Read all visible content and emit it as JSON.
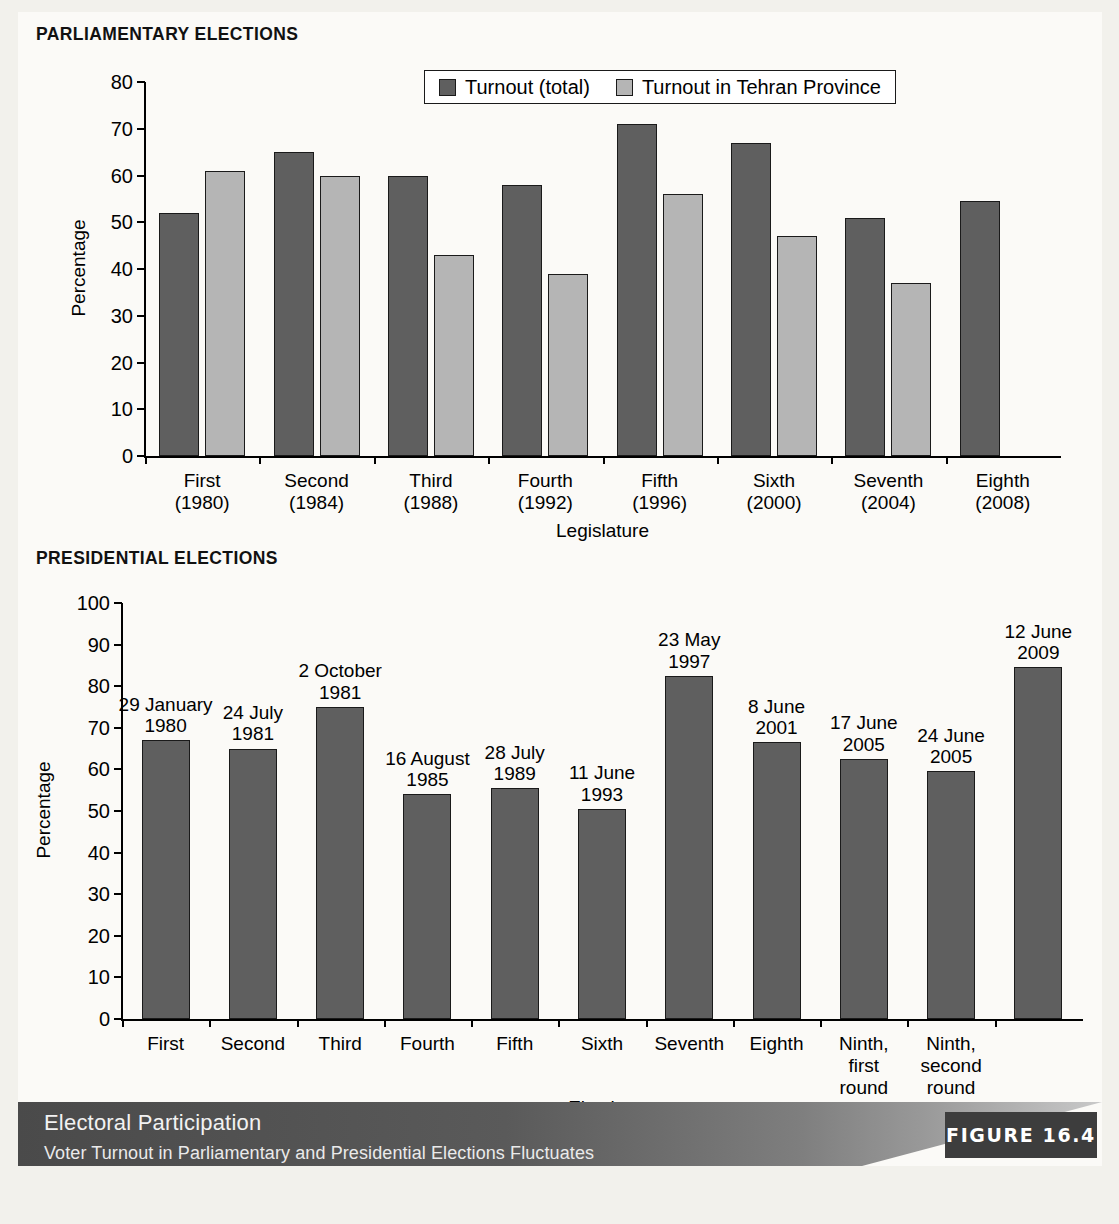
{
  "figure": {
    "banner_title": "Electoral Participation",
    "banner_subtitle": "Voter Turnout in Parliamentary and Presidential Elections Fluctuates",
    "figure_label": "FIGURE 16.4"
  },
  "colors": {
    "series_total": "#5f5f5f",
    "series_tehran": "#b5b5b5",
    "bar_outline": "#1a1a1a",
    "banner_dark": "#4a4a4a",
    "figure_box": "#3d3d3d",
    "page_background": "#f2f1ec",
    "paper_background": "#fbfaf7"
  },
  "parliamentary": {
    "section_title": "PARLIAMENTARY ELECTIONS",
    "legend": [
      {
        "label": "Turnout (total)",
        "swatch": "dark"
      },
      {
        "label": "Turnout in Tehran Province",
        "swatch": "light"
      }
    ]
  },
  "presidential": {
    "section_title": "PRESIDENTIAL ELECTIONS"
  },
  "chart_data": [
    {
      "type": "bar",
      "title": "PARLIAMENTARY ELECTIONS",
      "xlabel": "Legislature",
      "ylabel": "Percentage",
      "ylim": [
        0,
        80
      ],
      "yticks": [
        0,
        10,
        20,
        30,
        40,
        50,
        60,
        70,
        80
      ],
      "ytick_labels": [
        "0",
        "10",
        "20",
        "30",
        "40",
        "50",
        "60",
        "70",
        "80"
      ],
      "grid": false,
      "legend_position": "top-center",
      "categories": [
        "First\n(1980)",
        "Second\n(1984)",
        "Third\n(1988)",
        "Fourth\n(1992)",
        "Fifth\n(1996)",
        "Sixth\n(2000)",
        "Seventh\n(2004)",
        "Eighth\n(2008)"
      ],
      "series": [
        {
          "name": "Turnout (total)",
          "color": "#5f5f5f",
          "values": [
            52,
            65,
            60,
            58,
            71,
            67,
            51,
            54.5
          ]
        },
        {
          "name": "Turnout in Tehran Province",
          "color": "#b5b5b5",
          "values": [
            61,
            60,
            43,
            39,
            56,
            47,
            37,
            null
          ]
        }
      ]
    },
    {
      "type": "bar",
      "title": "PRESIDENTIAL ELECTIONS",
      "xlabel": "Election",
      "ylabel": "Percentage",
      "ylim": [
        0,
        100
      ],
      "yticks": [
        0,
        10,
        20,
        30,
        40,
        50,
        60,
        70,
        80,
        90,
        100
      ],
      "ytick_labels": [
        "0",
        "10",
        "20",
        "30",
        "40",
        "50",
        "60",
        "70",
        "80",
        "90",
        "100"
      ],
      "grid": false,
      "legend_position": "none",
      "categories": [
        "First",
        "Second",
        "Third",
        "Fourth",
        "Fifth",
        "Sixth",
        "Seventh",
        "Eighth",
        "Ninth,\nfirst\nround",
        "Ninth,\nsecond\nround",
        ""
      ],
      "point_labels": [
        "29 January\n1980",
        "24 July\n1981",
        "2 October\n1981",
        "16 August\n1985",
        "28 July\n1989",
        "11 June\n1993",
        "23 May\n1997",
        "8 June\n2001",
        "17 June\n2005",
        "24 June\n2005",
        "12 June\n2009"
      ],
      "series": [
        {
          "name": "Turnout",
          "color": "#5f5f5f",
          "values": [
            67,
            65,
            75,
            54,
            55.5,
            50.5,
            82.5,
            66.5,
            62.5,
            59.5,
            84.5
          ]
        }
      ]
    }
  ]
}
